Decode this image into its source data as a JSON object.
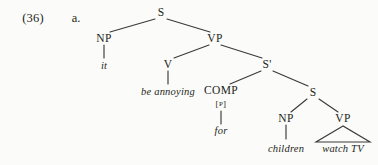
{
  "example": {
    "number": "(36)",
    "letter": "a."
  },
  "colors": {
    "background": "#fbfbf9",
    "ink": "#231f20",
    "line": "#3a3a3a"
  },
  "tree": {
    "caption": "Syntax tree for: it be annoying for children watch TV",
    "nodes": [
      {
        "id": "S_root",
        "label": "S",
        "x": 161,
        "y": 13
      },
      {
        "id": "NP_subj",
        "label": "NP",
        "x": 104,
        "y": 39
      },
      {
        "id": "VP_main",
        "label": "VP",
        "x": 215,
        "y": 39
      },
      {
        "id": "V",
        "label": "V",
        "x": 168,
        "y": 65
      },
      {
        "id": "Sbar",
        "label": "S'",
        "x": 267,
        "y": 65
      },
      {
        "id": "COMP",
        "label": "COMP",
        "x": 221,
        "y": 91
      },
      {
        "id": "S_emb",
        "label": "S",
        "x": 313,
        "y": 93
      },
      {
        "id": "NP_emb",
        "label": "NP",
        "x": 286,
        "y": 119
      },
      {
        "id": "VP_emb",
        "label": "VP",
        "x": 343,
        "y": 119
      }
    ],
    "feature_bracket": {
      "open": "[",
      "value": "P",
      "close": "]",
      "x": 221,
      "y": 105
    },
    "terminals": [
      {
        "id": "t_it",
        "text": "it",
        "x": 104,
        "y": 66
      },
      {
        "id": "t_be",
        "text": "be annoying",
        "x": 168,
        "y": 92
      },
      {
        "id": "t_for",
        "text": "for",
        "x": 221,
        "y": 131
      },
      {
        "id": "t_children",
        "text": "children",
        "x": 286,
        "y": 150
      },
      {
        "id": "t_watchtv",
        "text": "watch TV",
        "x": 343,
        "y": 150
      }
    ]
  }
}
